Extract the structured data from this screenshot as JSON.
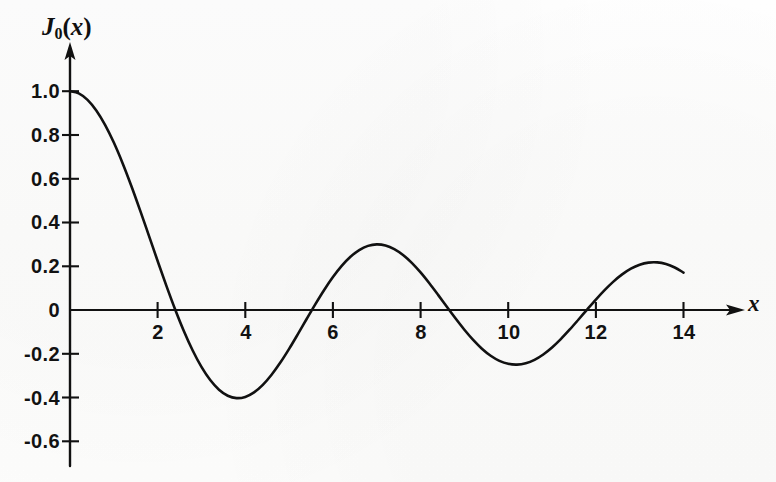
{
  "figure": {
    "background_color": "#fefefe",
    "ink_color": "#111111"
  },
  "chart_data": {
    "type": "line",
    "title": "",
    "subtitle": "",
    "xlabel": "x",
    "ylabel": "J₀(x)",
    "ylabel_parts": {
      "letter": "J",
      "subscript": "0",
      "open_paren": "(",
      "argument": "x",
      "close_paren": ")"
    },
    "xlim": [
      0,
      14.6
    ],
    "ylim": [
      -0.72,
      1.12
    ],
    "grid": false,
    "legend": null,
    "legend_position": "none",
    "xticks": [
      2,
      4,
      6,
      8,
      10,
      12,
      14
    ],
    "xtick_labels": [
      "2",
      "4",
      "6",
      "8",
      "10",
      "12",
      "14"
    ],
    "yticks": [
      1.0,
      0.8,
      0.6,
      0.4,
      0.2,
      0,
      -0.2,
      -0.4,
      -0.6
    ],
    "ytick_labels": [
      "1.0",
      "0.8",
      "0.6",
      "0.4",
      "0.2",
      "0",
      "-0.2",
      "-0.4",
      "-0.6"
    ],
    "axis_arrows": [
      "x-right",
      "y-up"
    ],
    "series": [
      {
        "name": "J_0(x)",
        "color": "#111111",
        "line_width": 2.6,
        "x": [
          0.0,
          0.2,
          0.4,
          0.6,
          0.8,
          1.0,
          1.2,
          1.4,
          1.6,
          1.8,
          2.0,
          2.2,
          2.4,
          2.6,
          2.8,
          3.0,
          3.2,
          3.4,
          3.6,
          3.8,
          4.0,
          4.2,
          4.4,
          4.6,
          4.8,
          5.0,
          5.2,
          5.4,
          5.6,
          5.8,
          6.0,
          6.2,
          6.4,
          6.6,
          6.8,
          7.0,
          7.2,
          7.4,
          7.6,
          7.8,
          8.0,
          8.2,
          8.4,
          8.6,
          8.8,
          9.0,
          9.2,
          9.4,
          9.6,
          9.8,
          10.0,
          10.2,
          10.4,
          10.6,
          10.8,
          11.0,
          11.2,
          11.4,
          11.6,
          11.8,
          12.0,
          12.2,
          12.4,
          12.6,
          12.8,
          13.0,
          13.2,
          13.4,
          13.6,
          13.8,
          14.0
        ],
        "y": [
          1.0,
          0.99,
          0.9604,
          0.912,
          0.8463,
          0.7652,
          0.6711,
          0.5669,
          0.4554,
          0.34,
          0.2239,
          0.1104,
          0.0025,
          -0.0968,
          -0.185,
          -0.2601,
          -0.3202,
          -0.3643,
          -0.3918,
          -0.4026,
          -0.3971,
          -0.3766,
          -0.3423,
          -0.2961,
          -0.2404,
          -0.1776,
          -0.1103,
          -0.0412,
          0.027,
          0.0917,
          0.1506,
          0.2017,
          0.2433,
          0.274,
          0.2931,
          0.3001,
          0.2951,
          0.2786,
          0.2516,
          0.2154,
          0.1717,
          0.1222,
          0.0692,
          0.0146,
          -0.0392,
          -0.0903,
          -0.1367,
          -0.1768,
          -0.209,
          -0.2323,
          -0.2459,
          -0.2496,
          -0.2434,
          -0.2276,
          -0.2032,
          -0.1712,
          -0.133,
          -0.0902,
          -0.0446,
          0.002,
          0.0477,
          0.0908,
          0.1296,
          0.1626,
          0.1887,
          0.2069,
          0.2167,
          0.2177,
          0.2101,
          0.1943,
          0.1711
        ],
        "zeros": [
          2.405,
          5.52,
          8.654,
          11.792
        ],
        "maxima": [
          {
            "x": 0.0,
            "y": 1.0
          },
          {
            "x": 7.016,
            "y": 0.3001
          },
          {
            "x": 13.324,
            "y": 0.2178
          }
        ],
        "minima": [
          {
            "x": 3.832,
            "y": -0.4028
          },
          {
            "x": 10.174,
            "y": -0.2497
          }
        ]
      }
    ],
    "annotations": []
  },
  "axis_titles": {
    "y": "J₀(x)",
    "x": "x"
  }
}
